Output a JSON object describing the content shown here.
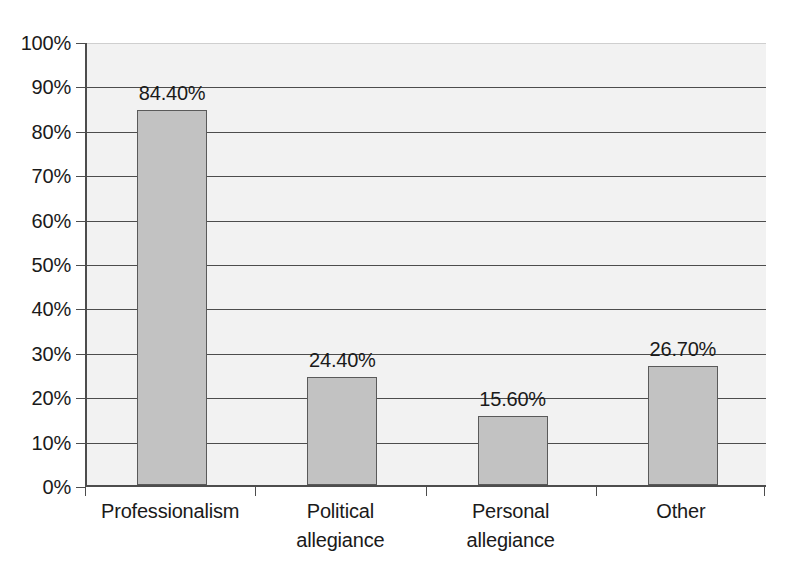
{
  "chart_data": {
    "type": "bar",
    "title": "",
    "subtitle": "",
    "xlabel": "",
    "ylabel": "",
    "categories": [
      "Professionalism",
      "Political allegiance",
      "Personal allegiance",
      "Other"
    ],
    "values": [
      84.4,
      24.4,
      15.6,
      26.7
    ],
    "value_labels": [
      "84.40%",
      "24.40%",
      "15.60%",
      "26.70%"
    ],
    "ylim": [
      0,
      100
    ],
    "ytick_values": [
      0,
      10,
      20,
      30,
      40,
      50,
      60,
      70,
      80,
      90,
      100
    ],
    "ytick_labels": [
      "0%",
      "10%",
      "20%",
      "30%",
      "40%",
      "50%",
      "60%",
      "70%",
      "80%",
      "90%",
      "100%"
    ],
    "grid": true,
    "grid_axis": "y",
    "legend": false,
    "legend_position": "none",
    "series": [
      {
        "name": "",
        "values": [
          84.4,
          24.4,
          15.6,
          26.7
        ]
      }
    ],
    "bar_fill_color": "#c2c2c2",
    "bar_border_color": "#5a5a5a",
    "plot_background_color": "#f2f2f2",
    "grid_color": "#4d4d4d",
    "axis_color": "#4d4d4d",
    "text_color": "#1a1a1a",
    "page_background_color": "#ffffff",
    "xtick_label_lines": [
      [
        "Professionalism"
      ],
      [
        "Political",
        "allegiance"
      ],
      [
        "Personal",
        "allegiance"
      ],
      [
        "Other"
      ]
    ]
  }
}
